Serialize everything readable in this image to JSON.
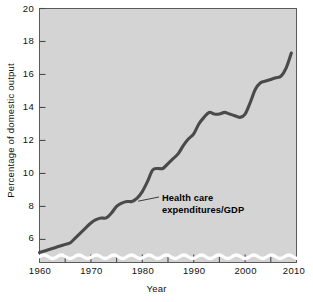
{
  "chart_data": {
    "type": "line",
    "title": "",
    "xlabel": "Year",
    "ylabel": "Percentage of domestic output",
    "xlim": [
      1960,
      2010
    ],
    "ylim": [
      4.6,
      20
    ],
    "grid": false,
    "legend_position": "inline-annotation",
    "axis_break": true,
    "x_ticks": [
      1960,
      1970,
      1980,
      1990,
      2000,
      2010
    ],
    "x_minor_ticks": [
      1965,
      1975,
      1985,
      1995,
      2005
    ],
    "y_ticks": [
      6,
      8,
      10,
      12,
      14,
      16,
      18,
      20
    ],
    "series": [
      {
        "name": "Health care expenditures/GDP",
        "color": "#4a4a4a",
        "x": [
          1960,
          1961,
          1962,
          1963,
          1964,
          1965,
          1966,
          1967,
          1968,
          1969,
          1970,
          1971,
          1972,
          1973,
          1974,
          1975,
          1976,
          1977,
          1978,
          1979,
          1980,
          1981,
          1982,
          1983,
          1984,
          1985,
          1986,
          1987,
          1988,
          1989,
          1990,
          1991,
          1992,
          1993,
          1994,
          1995,
          1996,
          1997,
          1998,
          1999,
          2000,
          2001,
          2002,
          2003,
          2004,
          2005,
          2006,
          2007,
          2008,
          2009
        ],
        "values": [
          5.2,
          5.3,
          5.4,
          5.5,
          5.6,
          5.7,
          5.8,
          6.1,
          6.4,
          6.7,
          7.0,
          7.2,
          7.3,
          7.3,
          7.6,
          8.0,
          8.2,
          8.3,
          8.3,
          8.5,
          8.9,
          9.5,
          10.2,
          10.3,
          10.3,
          10.6,
          10.9,
          11.2,
          11.7,
          12.1,
          12.4,
          13.0,
          13.4,
          13.7,
          13.6,
          13.6,
          13.7,
          13.6,
          13.5,
          13.4,
          13.6,
          14.3,
          15.1,
          15.5,
          15.6,
          15.7,
          15.8,
          15.9,
          16.4,
          17.3
        ],
        "units": "percent of GDP"
      }
    ],
    "annotation": {
      "line1": "Health care",
      "line2": "expenditures/GDP",
      "points_to_year": 1979,
      "points_to_value": 8.5
    }
  },
  "axis": {
    "x_title": "Year",
    "y_title": "Percentage of domestic output",
    "x_labels": [
      "1960",
      "1970",
      "1980",
      "1990",
      "2000",
      "2010"
    ],
    "y_labels": [
      "6",
      "8",
      "10",
      "12",
      "14",
      "16",
      "18",
      "20"
    ]
  },
  "colors": {
    "plot_background": "#d4d4d4",
    "frame": "#5a5a5a",
    "series": "#4a4a4a",
    "break_wave": "#ffffff",
    "page_background": "#ffffff"
  }
}
